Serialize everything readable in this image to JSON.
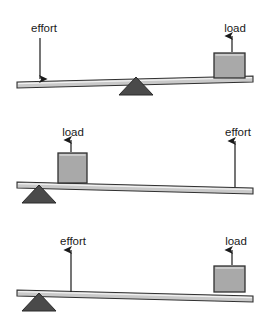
{
  "figure": {
    "background_color": "#ffffff",
    "colors": {
      "beam_fill": "#c9c9c9",
      "beam_stroke": "#303030",
      "block_fill": "#a9a9a9",
      "block_stroke": "#303030",
      "fulcrum_fill": "#4a4a4a",
      "fulcrum_stroke": "#2a2a2a",
      "arrow": "#1a1a1a",
      "label_text": "#1a1a1a"
    },
    "diagrams": [
      {
        "id": "lever-class-1",
        "name": "first-class-lever",
        "fulcrum_position": "center",
        "beam": {
          "x1": 17,
          "y1": 82,
          "x2": 253,
          "y2": 76,
          "thickness": 6
        },
        "fulcrum": {
          "cx": 136,
          "base_y": 95,
          "half_width": 17,
          "height": 18
        },
        "block": {
          "x": 214,
          "y": 53,
          "width": 31,
          "height": 25
        },
        "forces": [
          {
            "label": "effort",
            "name": "effort",
            "direction": "down",
            "label_x": 44,
            "label_y": 32,
            "arrow_x": 40,
            "arrow_from_y": 38,
            "arrow_to_y": 79
          },
          {
            "label": "load",
            "name": "load",
            "direction": "up",
            "label_x": 235,
            "label_y": 32,
            "arrow_x": 232,
            "arrow_from_y": 52,
            "arrow_to_y": 36
          }
        ]
      },
      {
        "id": "lever-class-2",
        "name": "second-class-lever",
        "fulcrum_position": "left",
        "beam": {
          "x1": 17,
          "y1": 182,
          "x2": 253,
          "y2": 188,
          "thickness": 6
        },
        "fulcrum": {
          "cx": 39,
          "base_y": 203,
          "half_width": 17,
          "height": 18
        },
        "block": {
          "x": 58,
          "y": 153,
          "width": 29,
          "height": 30
        },
        "forces": [
          {
            "label": "load",
            "name": "load",
            "direction": "up",
            "label_x": 73,
            "label_y": 136,
            "arrow_x": 71,
            "arrow_from_y": 152,
            "arrow_to_y": 140
          },
          {
            "label": "effort",
            "name": "effort",
            "direction": "up",
            "label_x": 238,
            "label_y": 136,
            "arrow_x": 235,
            "arrow_from_y": 187,
            "arrow_to_y": 141
          }
        ]
      },
      {
        "id": "lever-class-3",
        "name": "third-class-lever",
        "fulcrum_position": "left",
        "beam": {
          "x1": 17,
          "y1": 290,
          "x2": 253,
          "y2": 296,
          "thickness": 6
        },
        "fulcrum": {
          "cx": 39,
          "base_y": 311,
          "half_width": 17,
          "height": 18
        },
        "block": {
          "x": 214,
          "y": 266,
          "width": 31,
          "height": 26
        },
        "forces": [
          {
            "label": "effort",
            "name": "effort",
            "direction": "up",
            "label_x": 73,
            "label_y": 245,
            "arrow_x": 71,
            "arrow_from_y": 292,
            "arrow_to_y": 250
          },
          {
            "label": "load",
            "name": "load",
            "direction": "up",
            "label_x": 236,
            "label_y": 245,
            "arrow_x": 232,
            "arrow_from_y": 265,
            "arrow_to_y": 250
          }
        ]
      }
    ]
  }
}
